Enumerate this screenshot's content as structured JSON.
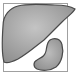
{
  "icon": {
    "name": "liver-and-organ-icon",
    "frame_color": "#9a9a9a",
    "organ_fill": "#a9a9a9",
    "organ_stroke": "#4a4a4a",
    "background": "#ffffff"
  }
}
